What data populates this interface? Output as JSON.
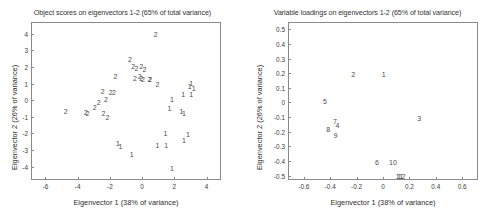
{
  "figure": {
    "width": 490,
    "height": 218,
    "background": "#ffffff",
    "axis_color": "#8a8a8a",
    "text_color": "#3a3a3a"
  },
  "chart_data": [
    {
      "id": "object-scores",
      "type": "scatter",
      "title": "Object scores on eigenvectors 1-2 (65% of total variance)",
      "xlabel": "Eigenvector 1 (38% of variance)",
      "ylabel": "Eigenvector 2 (26% of variance)",
      "xlim": [
        -6.9,
        4.9
      ],
      "ylim": [
        -4.8,
        4.7
      ],
      "xticks": [
        -6,
        -4,
        -2,
        0,
        2,
        4
      ],
      "xticklabels": [
        "-6",
        "-4",
        "-2",
        "0",
        "2",
        "4"
      ],
      "yticks": [
        -4,
        -3,
        -2,
        -1,
        0,
        1,
        2,
        3,
        4
      ],
      "yticklabels": [
        "-4",
        "-3",
        "-2",
        "-1",
        "0",
        "1",
        "2",
        "3",
        "4"
      ],
      "grid": false,
      "legend": "none",
      "marker_style": "text-label",
      "points": [
        {
          "label": "2",
          "x": 0.85,
          "y": 4.0
        },
        {
          "label": "2",
          "x": -0.75,
          "y": 2.45
        },
        {
          "label": "2",
          "x": -0.55,
          "y": 2.05
        },
        {
          "label": "2",
          "x": -0.35,
          "y": 1.95
        },
        {
          "label": "2",
          "x": -0.05,
          "y": 2.05
        },
        {
          "label": "2",
          "x": 0.15,
          "y": 1.85
        },
        {
          "label": "2",
          "x": -1.65,
          "y": 1.45
        },
        {
          "label": "2",
          "x": -0.45,
          "y": 1.35
        },
        {
          "label": "2",
          "x": -0.15,
          "y": 1.45
        },
        {
          "label": "2",
          "x": -0.05,
          "y": 1.35
        },
        {
          "label": "2",
          "x": 0.05,
          "y": 1.3
        },
        {
          "label": "2",
          "x": 0.45,
          "y": 1.3
        },
        {
          "label": "2",
          "x": 0.5,
          "y": 1.25
        },
        {
          "label": "2",
          "x": 0.95,
          "y": 1.0
        },
        {
          "label": "2",
          "x": -2.45,
          "y": 0.55
        },
        {
          "label": "2",
          "x": -1.95,
          "y": 0.5
        },
        {
          "label": "2",
          "x": -1.75,
          "y": 0.5
        },
        {
          "label": "2",
          "x": -2.25,
          "y": 0.1
        },
        {
          "label": "2",
          "x": -2.7,
          "y": -0.1
        },
        {
          "label": "2",
          "x": -2.95,
          "y": -0.4
        },
        {
          "label": "2",
          "x": -3.5,
          "y": -0.7
        },
        {
          "label": "2",
          "x": -3.4,
          "y": -0.8
        },
        {
          "label": "2",
          "x": -2.4,
          "y": -0.75
        },
        {
          "label": "2",
          "x": -2.15,
          "y": -1.0
        },
        {
          "label": "2",
          "x": -4.75,
          "y": -0.65
        },
        {
          "label": "1",
          "x": 3.05,
          "y": 1.05
        },
        {
          "label": "1",
          "x": 2.95,
          "y": 0.85
        },
        {
          "label": "1",
          "x": 3.2,
          "y": 0.75
        },
        {
          "label": "1",
          "x": 2.55,
          "y": 0.35
        },
        {
          "label": "1",
          "x": 3.05,
          "y": 0.35
        },
        {
          "label": "1",
          "x": 1.85,
          "y": 0.1
        },
        {
          "label": "1",
          "x": 1.7,
          "y": -0.45
        },
        {
          "label": "1",
          "x": 2.45,
          "y": -0.65
        },
        {
          "label": "1",
          "x": 2.6,
          "y": -0.75
        },
        {
          "label": "1",
          "x": 1.45,
          "y": -2.0
        },
        {
          "label": "1",
          "x": 2.85,
          "y": -2.05
        },
        {
          "label": "1",
          "x": 2.6,
          "y": -2.4
        },
        {
          "label": "1",
          "x": -1.5,
          "y": -2.6
        },
        {
          "label": "1",
          "x": -1.35,
          "y": -2.75
        },
        {
          "label": "1",
          "x": 0.95,
          "y": -2.7
        },
        {
          "label": "1",
          "x": 1.5,
          "y": -2.7
        },
        {
          "label": "1",
          "x": -0.65,
          "y": -3.25
        },
        {
          "label": "1",
          "x": 1.85,
          "y": -4.1
        }
      ]
    },
    {
      "id": "variable-loadings",
      "type": "scatter",
      "title": "Variable loadings on eigenvectors 1-2 (65% of total variance)",
      "xlabel": "Eigenvector 1 (38% of variance)",
      "ylabel": "Eigenvector 2 (26% of variance)",
      "xlim": [
        -0.72,
        0.72
      ],
      "ylim": [
        -0.53,
        0.55
      ],
      "xticks": [
        -0.6,
        -0.4,
        -0.2,
        0,
        0.2,
        0.4,
        0.6
      ],
      "xticklabels": [
        "-0.6",
        "-0.4",
        "-0.2",
        "0",
        "0.2",
        "0.4",
        "0.6"
      ],
      "yticks": [
        -0.5,
        -0.4,
        -0.3,
        -0.2,
        -0.1,
        0,
        0.1,
        0.2,
        0.3,
        0.4,
        0.5
      ],
      "yticklabels": [
        "-0.5",
        "-0.4",
        "-0.3",
        "-0.2",
        "-0.1",
        "0",
        "0.1",
        "0.2",
        "0.3",
        "0.4",
        "0.5"
      ],
      "grid": false,
      "legend": "none",
      "marker_style": "text-label",
      "points": [
        {
          "label": "1",
          "x": 0.005,
          "y": 0.195
        },
        {
          "label": "2",
          "x": -0.225,
          "y": 0.195
        },
        {
          "label": "3",
          "x": 0.275,
          "y": -0.105
        },
        {
          "label": "4",
          "x": -0.345,
          "y": -0.155
        },
        {
          "label": "5",
          "x": -0.44,
          "y": 0.01
        },
        {
          "label": "6",
          "x": -0.045,
          "y": -0.405
        },
        {
          "label": "7",
          "x": -0.365,
          "y": -0.125
        },
        {
          "label": "8",
          "x": -0.415,
          "y": -0.18
        },
        {
          "label": "9",
          "x": -0.36,
          "y": -0.225
        },
        {
          "label": "10",
          "x": 0.075,
          "y": -0.405
        },
        {
          "label": "11",
          "x": 0.125,
          "y": -0.5
        },
        {
          "label": "12",
          "x": 0.14,
          "y": -0.5
        }
      ]
    }
  ]
}
